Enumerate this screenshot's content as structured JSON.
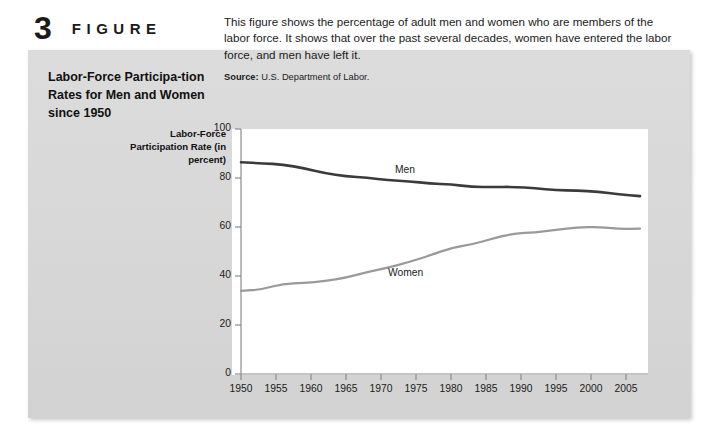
{
  "figure": {
    "number": "3",
    "word": "FIGURE",
    "caption": "Labor-Force Participa-tion Rates for Men and Women since 1950",
    "description": "This figure shows the percentage of adult men and women who are members of the labor force. It shows that over the past several decades, women have entered the labor force, and men have left it.",
    "source_label": "Source:",
    "source_text": "U.S. Department of Labor."
  },
  "colors": {
    "panel_background": "#d9d9d9",
    "page_background": "#ffffff",
    "plot_background": "#ffffff",
    "men_line": "#3b3b3b",
    "women_line": "#9a9a9a",
    "axis": "#8c8c8c",
    "text": "#1b1b1b"
  },
  "chart_data": {
    "type": "line",
    "title": "",
    "ylabel": "Labor-Force Participation Rate (in percent)",
    "xlabel": "",
    "xlim": [
      1950,
      2007
    ],
    "ylim": [
      0,
      100
    ],
    "grid": false,
    "legend": "inline-annotations",
    "yticks": [
      0,
      20,
      40,
      60,
      80,
      100
    ],
    "ytick_labels": [
      "0",
      "20",
      "40",
      "60",
      "80",
      "100"
    ],
    "xticks": [
      1950,
      1955,
      1960,
      1965,
      1970,
      1975,
      1980,
      1985,
      1990,
      1995,
      2000,
      2005
    ],
    "xtick_labels": [
      "1950",
      "1955",
      "1960",
      "1965",
      "1970",
      "1975",
      "1980",
      "1985",
      "1990",
      "1995",
      "2000",
      "2005"
    ],
    "x": [
      1950,
      1953,
      1956,
      1959,
      1962,
      1965,
      1968,
      1971,
      1974,
      1977,
      1980,
      1983,
      1986,
      1989,
      1992,
      1995,
      1998,
      2001,
      2004,
      2007
    ],
    "series": [
      {
        "name": "Men",
        "color": "#3b3b3b",
        "annotation": "Men",
        "annotation_x": 1972,
        "annotation_y": 83,
        "values": [
          86.4,
          86.0,
          85.5,
          84.0,
          82.0,
          80.7,
          80.1,
          79.1,
          78.7,
          77.7,
          77.4,
          76.4,
          76.3,
          76.4,
          75.8,
          75.0,
          74.9,
          74.4,
          73.3,
          72.6
        ]
      },
      {
        "name": "Women",
        "color": "#9a9a9a",
        "annotation": "Women",
        "annotation_x": 1971,
        "annotation_y": 41,
        "values": [
          33.9,
          34.5,
          36.9,
          37.1,
          37.9,
          39.3,
          41.6,
          43.4,
          45.7,
          48.4,
          51.5,
          52.9,
          55.3,
          57.4,
          57.8,
          58.9,
          59.8,
          60.1,
          59.2,
          59.3
        ]
      }
    ]
  }
}
